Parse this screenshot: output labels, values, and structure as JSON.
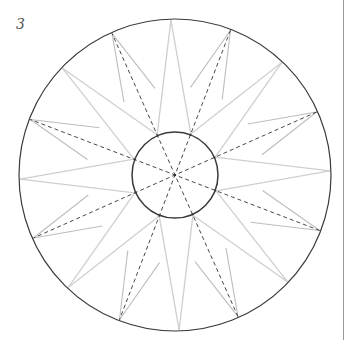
{
  "label": "3",
  "figure": {
    "name": "16-point compass star construction",
    "center": [
      175,
      175
    ],
    "outer_radius": 156,
    "inner_radius": 43,
    "wide_star": {
      "points": 8,
      "start_angle_deg": -1.5,
      "valley_radius": 44
    },
    "narrow_star": {
      "points": 8,
      "start_angle_deg": 21,
      "side_radius": 89,
      "side_offset_deg": 11
    },
    "dashed_diameters": 4,
    "colors": {
      "circle": "#3a3a3a",
      "star_lines": "#cfcfcf",
      "narrow_lines": "#bdbdbd",
      "dashed": "#333333",
      "rule": "#9a9a9a"
    }
  }
}
